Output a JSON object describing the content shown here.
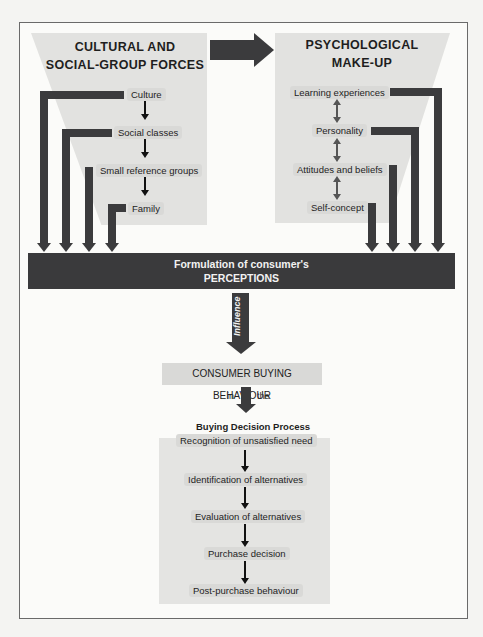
{
  "diagram": {
    "left_group": {
      "heading_line1": "CULTURAL AND",
      "heading_line2": "SOCIAL-GROUP FORCES",
      "items": [
        "Culture",
        "Social classes",
        "Small reference groups",
        "Family"
      ]
    },
    "right_group": {
      "heading_line1": "PSYCHOLOGICAL",
      "heading_line2": "MAKE-UP",
      "items": [
        "Learning experiences",
        "Personality",
        "Attitudes and beliefs",
        "Self-concept"
      ]
    },
    "perceptions": {
      "line1": "Formulation of consumer's",
      "line2": "PERCEPTIONS"
    },
    "influence_label": "Influence",
    "behaviour": {
      "title": "CONSUMER BUYING BEHAVIOUR",
      "connector_left": "in",
      "connector_right": "the"
    },
    "process": {
      "title": "Buying Decision Process",
      "steps": [
        "Recognition of unsatisfied need",
        "Identification of alternatives",
        "Evaluation of alternatives",
        "Purchase decision",
        "Post-purchase behaviour"
      ]
    },
    "colors": {
      "dark_arrow": "#3b3b3d",
      "shade": "#e2e2e0",
      "label_bg": "#d9d9d7"
    }
  }
}
